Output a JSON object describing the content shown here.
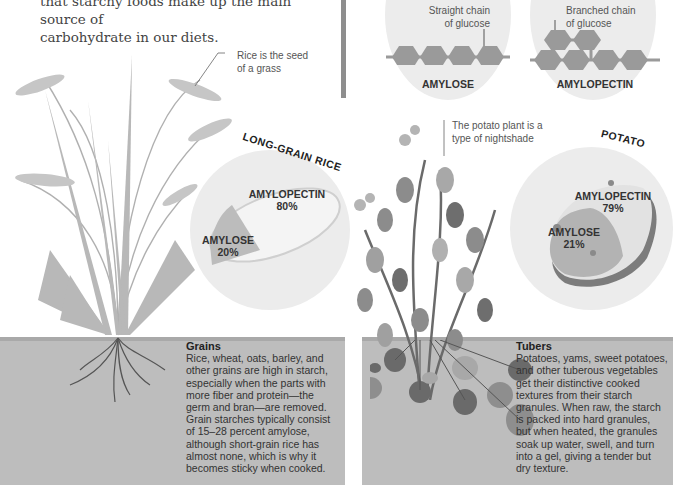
{
  "intro": {
    "line1": "that starchy foods make up the main source of",
    "line2": "carbohydrate in our diets."
  },
  "molecules": {
    "amylose": {
      "callout_line1": "Straight chain",
      "callout_line2": "of glucose",
      "label": "AMYLOSE"
    },
    "amylopectin": {
      "callout_line1": "Branched chain",
      "callout_line2": "of glucose",
      "label": "AMYLOPECTIN"
    }
  },
  "rice": {
    "callout_line1": "Rice is the seed",
    "callout_line2": "of a grass",
    "title": "LONG-GRAIN RICE",
    "amylopectin_label": "AMYLOPECTIN",
    "amylopectin_pct": "80%",
    "amylose_label": "AMYLOSE",
    "amylose_pct": "20%"
  },
  "potato": {
    "callout_line1": "The potato plant is a",
    "callout_line2": "type of nightshade",
    "title": "POTATO",
    "amylopectin_label": "AMYLOPECTIN",
    "amylopectin_pct": "79%",
    "amylose_label": "AMYLOSE",
    "amylose_pct": "21%"
  },
  "grains": {
    "heading": "Grains",
    "lines": [
      "Rice, wheat, oats, barley, and",
      "other grains are high in starch,",
      "especially when the parts with",
      "more fiber and protein—the",
      "germ and bran—are removed.",
      "Grain starches typically consist",
      "of 15–28 percent amylose,",
      "although short-grain rice has",
      "almost none, which is why it",
      "becomes sticky when cooked."
    ]
  },
  "tubers": {
    "heading": "Tubers",
    "lines": [
      "Potatoes, yams, sweet potatoes,",
      "and other tuberous vegetables",
      "get their distinctive cooked",
      "textures from their starch",
      "granules. When raw, the starch",
      "is packed into hard granules,",
      "but when heated, the granules",
      "soak up water, swell, and turn",
      "into a gel, giving a tender but",
      "dry texture."
    ]
  },
  "colors": {
    "soil": "#bdbdbd",
    "disc": "#ececec",
    "hexagon": "#9a9a9a",
    "divider": "#8e8e8e"
  }
}
